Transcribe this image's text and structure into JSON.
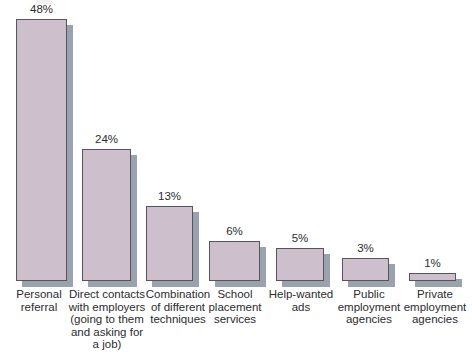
{
  "chart_data": {
    "type": "bar",
    "title": "",
    "subtitle": "",
    "xlabel": "",
    "ylabel": "",
    "ylim": [
      0,
      50
    ],
    "grid": false,
    "legend": "none",
    "orientation": "vertical",
    "value_suffix": "%",
    "categories": [
      "Personal referral",
      "Direct contacts with employers (going to them and asking for a job)",
      "Combination of different techniques",
      "School placement services",
      "Help-wanted ads",
      "Public employment agencies",
      "Private employment agencies"
    ],
    "values": [
      48,
      24,
      13,
      6,
      5,
      3,
      1
    ],
    "value_labels": [
      "48%",
      "24%",
      "13%",
      "6%",
      "5%",
      "3%",
      "1%"
    ],
    "category_label_lines": [
      [
        "Personal",
        "referral"
      ],
      [
        "Direct contacts",
        "with employers",
        "(going to them",
        "and asking for",
        "a job)"
      ],
      [
        "Combination",
        "of different",
        "techniques"
      ],
      [
        "School",
        "placement",
        "services"
      ],
      [
        "Help-wanted",
        "ads"
      ],
      [
        "Public",
        "employment",
        "agencies"
      ],
      [
        "Private",
        "employment",
        "agencies"
      ]
    ]
  },
  "style": {
    "bar_fill": "#cdc0cc",
    "bar_border": "#55555f",
    "bar_shadow": "#9aa3ad",
    "background": "#ffffff",
    "text_color": "#2c2c30"
  },
  "geometry": {
    "baseline_y": 281,
    "bars": [
      {
        "left": 16,
        "width": 51,
        "height": 262
      },
      {
        "left": 82,
        "width": 49,
        "height": 132
      },
      {
        "left": 146,
        "width": 47,
        "height": 75
      },
      {
        "left": 209,
        "width": 51,
        "height": 40
      },
      {
        "left": 276,
        "width": 48,
        "height": 33
      },
      {
        "left": 342,
        "width": 47,
        "height": 23
      },
      {
        "left": 409,
        "width": 47,
        "height": 8
      }
    ],
    "labels": [
      {
        "left": 8,
        "width": 62
      },
      {
        "left": 67,
        "width": 80
      },
      {
        "left": 142,
        "width": 72
      },
      {
        "left": 204,
        "width": 62
      },
      {
        "left": 266,
        "width": 70
      },
      {
        "left": 334,
        "width": 70
      },
      {
        "left": 400,
        "width": 70
      }
    ]
  }
}
